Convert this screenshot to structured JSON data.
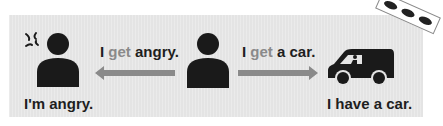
{
  "left": {
    "caption": "I'm angry.",
    "icon": "angry-person-icon"
  },
  "middle": {
    "icon": "person-icon"
  },
  "right": {
    "caption": "I have a car.",
    "icon": "car-with-driver-icon"
  },
  "arrow_left": {
    "pre": "I ",
    "verb": "get",
    "post": " angry.",
    "direction": "left"
  },
  "arrow_right": {
    "pre": "I ",
    "verb": "get",
    "post": " a car.",
    "direction": "right"
  },
  "corner_tag": {
    "icon": "three-cars-icon"
  },
  "colors": {
    "panel": "#e4e4e4",
    "text": "#1e1e1e",
    "verb": "#8a8a8a",
    "arrow": "#8a8a8a",
    "figure": "#1a1a1a"
  }
}
